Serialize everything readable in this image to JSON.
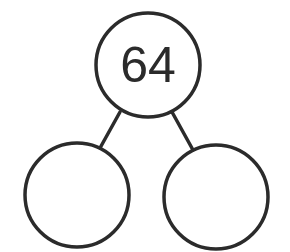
{
  "diagram": {
    "type": "number-bond",
    "whole": {
      "value": "64"
    },
    "parts": [
      {
        "value": ""
      },
      {
        "value": ""
      }
    ],
    "colors": {
      "stroke": "#2b2b2b",
      "background": "#ffffff",
      "text": "#2b2b2b"
    }
  }
}
